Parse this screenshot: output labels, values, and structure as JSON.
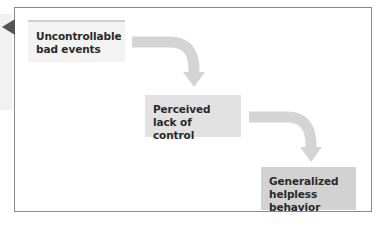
{
  "diagram": {
    "type": "flow",
    "nodes": [
      {
        "id": "n1",
        "label_line1": "Uncontrollable",
        "label_line2": "bad events",
        "fill": "#f3f3f3"
      },
      {
        "id": "n2",
        "label_line1": "Perceived",
        "label_line2": "lack of control",
        "fill": "#e2e2e2"
      },
      {
        "id": "n3",
        "label_line1": "Generalized",
        "label_line2": "helpless behavior",
        "fill": "#d2d2d2"
      }
    ],
    "edges": [
      {
        "from": "n1",
        "to": "n2"
      },
      {
        "from": "n2",
        "to": "n3"
      }
    ],
    "colors": {
      "frame_border": "#8a8a8a",
      "arrow": "#d4d4d4",
      "pointer": "#555555",
      "text": "#2a2a2a"
    }
  }
}
